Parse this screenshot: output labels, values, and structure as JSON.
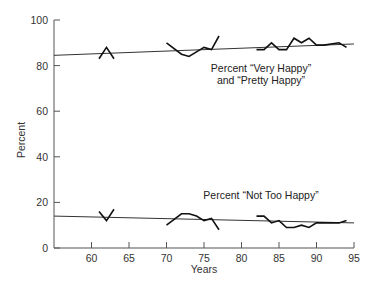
{
  "chart_data": {
    "type": "line",
    "title": "",
    "xlabel": "Years",
    "ylabel": "Percent",
    "xlim": [
      55,
      95
    ],
    "ylim": [
      0,
      100
    ],
    "x_ticks": [
      60,
      65,
      70,
      75,
      80,
      85,
      90,
      95
    ],
    "y_ticks": [
      0,
      20,
      40,
      60,
      80,
      100
    ],
    "grid": false,
    "legend": null,
    "series": [
      {
        "name": "Percent \"Very Happy\" and \"Pretty Happy\"",
        "segments": [
          {
            "x": [
              61,
              62,
              63
            ],
            "y": [
              83,
              88,
              83
            ]
          },
          {
            "x": [
              70,
              72,
              73,
              74,
              75,
              76,
              77
            ],
            "y": [
              90,
              85,
              84,
              86,
              88,
              87,
              93
            ]
          },
          {
            "x": [
              82,
              83,
              84,
              85,
              86,
              87,
              88,
              89,
              90,
              91,
              93,
              94
            ],
            "y": [
              87,
              87,
              90,
              87,
              87,
              92,
              90,
              92,
              89,
              89,
              90,
              88
            ]
          }
        ],
        "trend": {
          "x": [
            55,
            95
          ],
          "y": [
            84.5,
            89.5
          ]
        }
      },
      {
        "name": "Percent \"Not Too Happy\"",
        "segments": [
          {
            "x": [
              61,
              62,
              63
            ],
            "y": [
              16,
              12,
              17
            ]
          },
          {
            "x": [
              70,
              72,
              73,
              74,
              75,
              76,
              77
            ],
            "y": [
              10,
              15,
              15,
              14,
              12,
              13,
              8
            ]
          },
          {
            "x": [
              82,
              83,
              84,
              85,
              86,
              87,
              88,
              89,
              90,
              91,
              93,
              94
            ],
            "y": [
              14,
              14,
              11,
              12,
              9,
              9,
              10,
              9,
              11,
              11,
              11,
              12
            ]
          }
        ],
        "trend": {
          "x": [
            55,
            95
          ],
          "y": [
            14,
            11
          ]
        }
      }
    ],
    "annotations": [
      {
        "text": "Percent \"Very Happy\"",
        "x": 82,
        "y": 80
      },
      {
        "text": "and \"Pretty Happy\"",
        "x": 82,
        "y": 75
      },
      {
        "text": "Percent \"Not Too Happy\"",
        "x": 82,
        "y": 19
      }
    ]
  },
  "labels": {
    "xlabel": "Years",
    "ylabel": "Percent",
    "upper_line1": "Percent “Very Happy”",
    "upper_line2": "and “Pretty Happy”",
    "lower_line1": "Percent “Not Too Happy”"
  }
}
